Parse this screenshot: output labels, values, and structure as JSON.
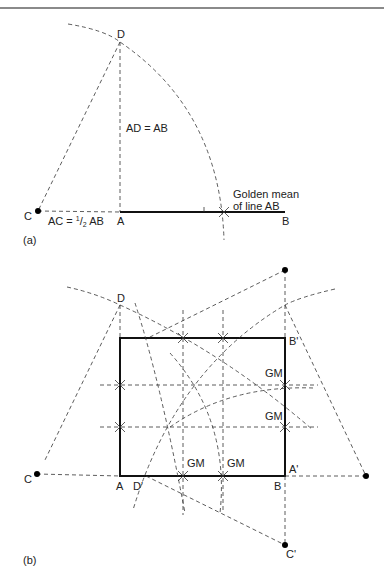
{
  "figure_a": {
    "panel_label": "(a)",
    "points": {
      "D": "D",
      "C": "C",
      "A": "A",
      "B": "B"
    },
    "eq_ad": "AD = AB",
    "eq_ac_prefix": "AC = ",
    "eq_ac_num": "1",
    "eq_ac_slash": "/",
    "eq_ac_den": "2",
    "eq_ac_suffix": " AB",
    "golden_line1": "Golden mean",
    "golden_line2": "of line AB"
  },
  "figure_b": {
    "panel_label": "(b)",
    "points": {
      "D": "D",
      "C": "C",
      "A": "A",
      "D_prime": "D'",
      "B": "B",
      "A_prime": "A'",
      "B_prime": "B'",
      "C_prime": "C'"
    },
    "gm_labels": [
      "GM",
      "GM",
      "GM",
      "GM"
    ]
  },
  "colors": {
    "line": "#111111",
    "dashed": "#333333",
    "background": "#ffffff"
  }
}
